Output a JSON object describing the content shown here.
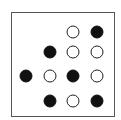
{
  "diagram": {
    "type": "dot-grid",
    "columns_x": [
      26,
      50,
      73,
      97
    ],
    "rows_y": [
      32,
      52,
      76,
      101
    ],
    "colors": {
      "filled": "#111111",
      "hollow_border": "#222222",
      "frame": "#555555"
    },
    "dots": [
      {
        "row": 0,
        "col": 2,
        "state": "hollow"
      },
      {
        "row": 0,
        "col": 3,
        "state": "filled"
      },
      {
        "row": 1,
        "col": 1,
        "state": "filled"
      },
      {
        "row": 1,
        "col": 2,
        "state": "hollow"
      },
      {
        "row": 1,
        "col": 3,
        "state": "hollow"
      },
      {
        "row": 2,
        "col": 0,
        "state": "filled"
      },
      {
        "row": 2,
        "col": 1,
        "state": "hollow"
      },
      {
        "row": 2,
        "col": 2,
        "state": "filled"
      },
      {
        "row": 2,
        "col": 3,
        "state": "hollow"
      },
      {
        "row": 3,
        "col": 1,
        "state": "filled"
      },
      {
        "row": 3,
        "col": 2,
        "state": "hollow"
      },
      {
        "row": 3,
        "col": 3,
        "state": "filled"
      }
    ]
  }
}
